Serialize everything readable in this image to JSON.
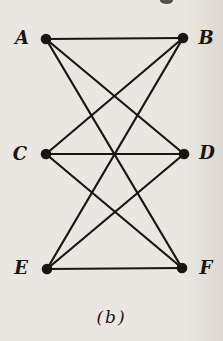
{
  "figure": {
    "caption": "(b)",
    "colors": {
      "background": "#eae7e2",
      "ink": "#19150f"
    },
    "graph": {
      "type": "undirected-graph",
      "description": "Complete bipartite graph K3,3 with parts {A, C, E} and {B, D, F}",
      "vertices": [
        {
          "id": "A",
          "label": "A",
          "x": 46,
          "y": 39,
          "label_x": 22,
          "label_y": 37
        },
        {
          "id": "B",
          "label": "B",
          "x": 183,
          "y": 38,
          "label_x": 206,
          "label_y": 37
        },
        {
          "id": "C",
          "label": "C",
          "x": 46,
          "y": 154,
          "label_x": 20,
          "label_y": 153
        },
        {
          "id": "D",
          "label": "D",
          "x": 184,
          "y": 154,
          "label_x": 207,
          "label_y": 152
        },
        {
          "id": "E",
          "label": "E",
          "x": 47,
          "y": 269,
          "label_x": 21,
          "label_y": 267
        },
        {
          "id": "F",
          "label": "F",
          "x": 182,
          "y": 268,
          "label_x": 206,
          "label_y": 267
        }
      ],
      "edges": [
        [
          "A",
          "B"
        ],
        [
          "A",
          "D"
        ],
        [
          "A",
          "F"
        ],
        [
          "B",
          "C"
        ],
        [
          "B",
          "E"
        ],
        [
          "C",
          "D"
        ],
        [
          "C",
          "F"
        ],
        [
          "D",
          "E"
        ],
        [
          "E",
          "F"
        ]
      ]
    }
  }
}
